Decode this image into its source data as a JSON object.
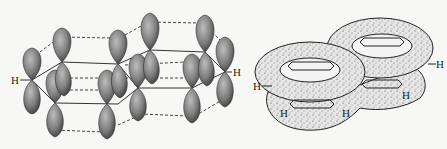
{
  "figure": {
    "left_panel": {
      "description": "p-orbital overlap in naphthalene",
      "labels": {
        "h_left": "H",
        "h_right": "H"
      }
    },
    "right_panel": {
      "description": "pi electron cloud of naphthalene",
      "labels": {
        "h_left": "H",
        "h_right": "H",
        "h_bottom_1": "H",
        "h_bottom_2": "H",
        "h_bottom_3": "H"
      }
    },
    "colors": {
      "lobe": "#8a8a8a",
      "lobe_dark": "#4a4a4a",
      "cloud": "#dcdcdc",
      "ink": "#222222",
      "background": "#f7f7f5"
    }
  }
}
